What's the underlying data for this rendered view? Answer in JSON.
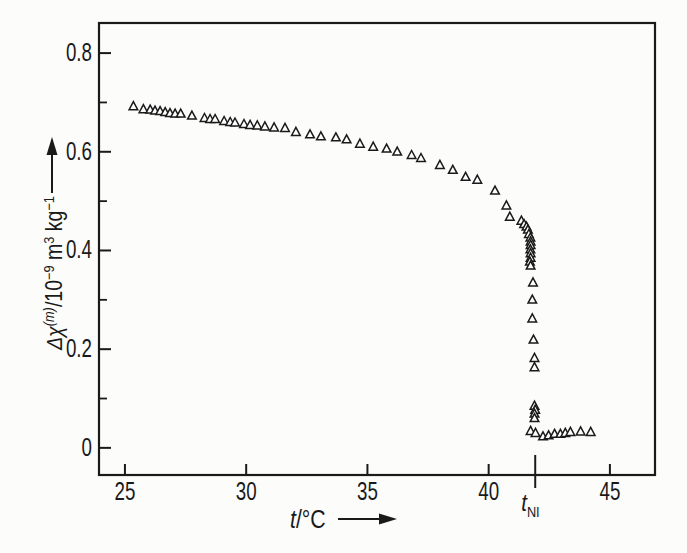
{
  "figure": {
    "background": "#fcfcfa",
    "ink": "#1a1a1a",
    "marker_fill": "#ffffff"
  },
  "chart_data": {
    "type": "scatter",
    "title": "",
    "marker": "open-triangle-up",
    "xlabel": "t/°C",
    "xlabel_segments": [
      {
        "t": "t",
        "italic": true
      },
      {
        "t": "/°C"
      }
    ],
    "ylabel": "Δχ(m)/10−9 m3 kg−1",
    "ylabel_segments": [
      {
        "t": "Δχ",
        "italic": true
      },
      {
        "t": "(m)",
        "sup": true,
        "italic": true
      },
      {
        "t": "/10"
      },
      {
        "t": "−9",
        "sup": true
      },
      {
        "t": " m"
      },
      {
        "t": "3",
        "sup": true
      },
      {
        "t": " kg"
      },
      {
        "t": "−1",
        "sup": true
      }
    ],
    "xlim": [
      23.93,
      46.86
    ],
    "ylim": [
      -0.055,
      0.861
    ],
    "grid": false,
    "legend": null,
    "x_ticks": [
      {
        "value": 25,
        "label": "25"
      },
      {
        "value": 30,
        "label": "30"
      },
      {
        "value": 35,
        "label": "35"
      },
      {
        "value": 40,
        "label": "40"
      },
      {
        "value": 45,
        "label": "45"
      }
    ],
    "y_ticks": [
      {
        "value": 0,
        "label": "0"
      },
      {
        "value": 0.2,
        "label": "0.2"
      },
      {
        "value": 0.4,
        "label": "0.4"
      },
      {
        "value": 0.6,
        "label": "0.6"
      },
      {
        "value": 0.8,
        "label": "0.8"
      }
    ],
    "y_minor_ticks": [
      0.1,
      0.3,
      0.5,
      0.7
    ],
    "annotations": [
      {
        "name": "nematic-isotropic-transition",
        "x": 41.92,
        "label_segments": [
          {
            "t": "t",
            "italic": true
          },
          {
            "t": "NI",
            "sub": true
          }
        ]
      }
    ],
    "points": [
      [
        25.35,
        0.692
      ],
      [
        25.76,
        0.686
      ],
      [
        26.04,
        0.685
      ],
      [
        26.24,
        0.683
      ],
      [
        26.45,
        0.682
      ],
      [
        26.66,
        0.68
      ],
      [
        26.86,
        0.678
      ],
      [
        27.07,
        0.677
      ],
      [
        27.3,
        0.677
      ],
      [
        27.76,
        0.673
      ],
      [
        28.28,
        0.668
      ],
      [
        28.51,
        0.666
      ],
      [
        28.72,
        0.666
      ],
      [
        29.09,
        0.662
      ],
      [
        29.34,
        0.66
      ],
      [
        29.54,
        0.659
      ],
      [
        29.91,
        0.656
      ],
      [
        30.16,
        0.654
      ],
      [
        30.46,
        0.653
      ],
      [
        30.77,
        0.651
      ],
      [
        31.15,
        0.649
      ],
      [
        31.6,
        0.648
      ],
      [
        32.05,
        0.64
      ],
      [
        32.63,
        0.635
      ],
      [
        33.08,
        0.631
      ],
      [
        33.7,
        0.629
      ],
      [
        34.14,
        0.625
      ],
      [
        34.69,
        0.616
      ],
      [
        35.24,
        0.61
      ],
      [
        35.79,
        0.606
      ],
      [
        36.23,
        0.6
      ],
      [
        36.82,
        0.593
      ],
      [
        37.21,
        0.587
      ],
      [
        37.99,
        0.573
      ],
      [
        38.52,
        0.563
      ],
      [
        39.05,
        0.549
      ],
      [
        39.53,
        0.543
      ],
      [
        40.26,
        0.521
      ],
      [
        40.73,
        0.491
      ],
      [
        40.87,
        0.468
      ],
      [
        41.35,
        0.46
      ],
      [
        41.46,
        0.453
      ],
      [
        41.56,
        0.448
      ],
      [
        41.62,
        0.442
      ],
      [
        41.66,
        0.433
      ],
      [
        41.72,
        0.426
      ],
      [
        41.73,
        0.418
      ],
      [
        41.73,
        0.411
      ],
      [
        41.72,
        0.402
      ],
      [
        41.73,
        0.394
      ],
      [
        41.73,
        0.385
      ],
      [
        41.7,
        0.377
      ],
      [
        41.73,
        0.369
      ],
      [
        41.83,
        0.335
      ],
      [
        41.8,
        0.3
      ],
      [
        41.8,
        0.262
      ],
      [
        41.85,
        0.219
      ],
      [
        41.89,
        0.182
      ],
      [
        41.89,
        0.163
      ],
      [
        41.89,
        0.085
      ],
      [
        41.92,
        0.077
      ],
      [
        41.89,
        0.069
      ],
      [
        41.89,
        0.06
      ],
      [
        41.73,
        0.034
      ],
      [
        41.93,
        0.03
      ],
      [
        42.24,
        0.023
      ],
      [
        42.47,
        0.025
      ],
      [
        42.72,
        0.028
      ],
      [
        42.96,
        0.028
      ],
      [
        43.16,
        0.03
      ],
      [
        43.37,
        0.032
      ],
      [
        43.79,
        0.033
      ],
      [
        44.21,
        0.032
      ]
    ]
  }
}
